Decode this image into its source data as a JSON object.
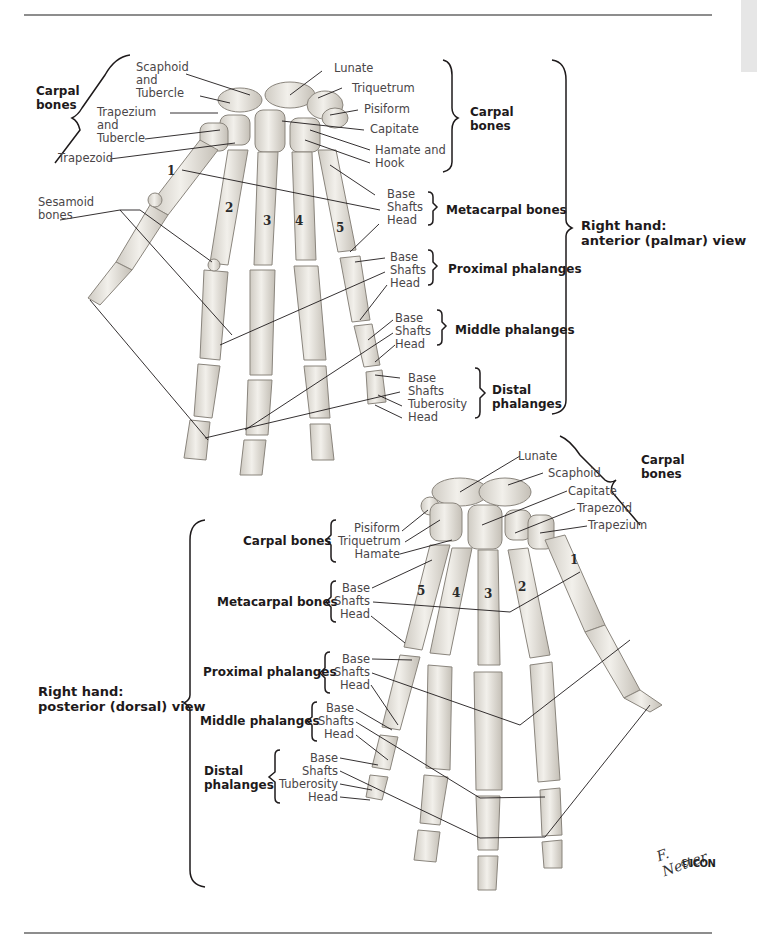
{
  "page": {
    "background": "#ffffff",
    "rule_color": "#8d8d8d",
    "tab_color": "#e6e6e6",
    "bone_fill": "#e9e6df",
    "bone_stroke": "#8a857d"
  },
  "anterior_view": {
    "title_line1": "Right hand:",
    "title_line2": "anterior (palmar) view",
    "carpal_left": {
      "group_line1": "Carpal",
      "group_line2": "bones",
      "labels": [
        "Scaphoid",
        "and",
        "Tubercle",
        "Trapezium",
        "and",
        "Tubercle",
        "Trapezoid"
      ]
    },
    "sesamoid": {
      "line1": "Sesamoid",
      "line2": "bones"
    },
    "carpal_right": {
      "group_line1": "Carpal",
      "group_line2": "bones",
      "labels": [
        "Lunate",
        "Triquetrum",
        "Pisiform",
        "Capitate",
        "Hamate and",
        "Hook"
      ]
    },
    "metacarpal": {
      "group": "Metacarpal bones",
      "labels": [
        "Base",
        "Shafts",
        "Head"
      ]
    },
    "proximal": {
      "group": "Proximal phalanges",
      "labels": [
        "Base",
        "Shafts",
        "Head"
      ]
    },
    "middle": {
      "group": "Middle phalanges",
      "labels": [
        "Base",
        "Shafts",
        "Head"
      ]
    },
    "distal": {
      "group_line1": "Distal",
      "group_line2": "phalanges",
      "labels": [
        "Base",
        "Shafts",
        "Tuberosity",
        "Head"
      ]
    },
    "digit_numbers": [
      "1",
      "2",
      "3",
      "4",
      "5"
    ]
  },
  "posterior_view": {
    "title_line1": "Right hand:",
    "title_line2": "posterior (dorsal) view",
    "carpal_right": {
      "group_line1": "Carpal",
      "group_line2": "bones",
      "labels": [
        "Lunate",
        "Scaphoid",
        "Capitate",
        "Trapezoid",
        "Trapezium"
      ]
    },
    "carpal_left": {
      "group": "Carpal bones",
      "labels": [
        "Pisiform",
        "Triquetrum",
        "Hamate"
      ]
    },
    "metacarpal": {
      "group": "Metacarpal bones",
      "labels": [
        "Base",
        "Shafts",
        "Head"
      ]
    },
    "proximal": {
      "group": "Proximal phalanges",
      "labels": [
        "Base",
        "Shafts",
        "Head"
      ]
    },
    "middle": {
      "group": "Middle phalanges",
      "labels": [
        "Base",
        "Shafts",
        "Head"
      ]
    },
    "distal": {
      "group_line1": "Distal",
      "group_line2": "phalanges",
      "labels": [
        "Base",
        "Shafts",
        "Tuberosity",
        "Head"
      ]
    },
    "digit_numbers": [
      "5",
      "4",
      "3",
      "2",
      "1"
    ]
  },
  "signature": {
    "name": "F. Netter",
    "suffix": "M.D.",
    "copyright": "©",
    "logo": "ICON"
  }
}
